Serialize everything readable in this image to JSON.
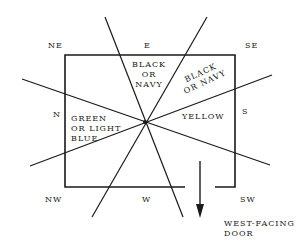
{
  "directions": {
    "ne": "NE",
    "e": "E",
    "se": "SE",
    "n": "N",
    "s": "S",
    "nw": "NW",
    "w": "W",
    "sw": "SW"
  },
  "zones": {
    "east_line1": "BLACK",
    "east_line2": "OR",
    "east_line3": "NAVY",
    "southeast_line1": "BLACK",
    "southeast_line2": "OR NAVY",
    "north_line1": "GREEN",
    "north_line2": "OR LIGHT",
    "north_line3": "BLUE",
    "south": "YELLOW"
  },
  "door": {
    "line1": "WEST-FACING",
    "line2": "DOOR"
  },
  "colors": {
    "ink": "#1a1a1a",
    "background": "#ffffff"
  }
}
